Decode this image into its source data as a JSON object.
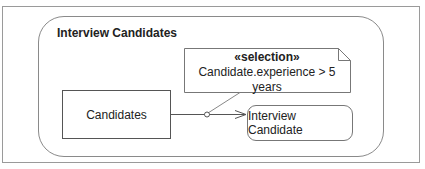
{
  "diagram": {
    "type": "UML activity diagram",
    "region": {
      "title": "Interview Candidates"
    },
    "nodes": [
      {
        "id": "candidates",
        "label": "Candidates",
        "kind": "object-node"
      },
      {
        "id": "interview-candidate",
        "label": "Interview Candidate",
        "kind": "action"
      }
    ],
    "note": {
      "stereotype": "«selection»",
      "body": "Candidate.experience > 5 years"
    },
    "edges": [
      {
        "from": "candidates",
        "to": "interview-candidate",
        "kind": "object-flow",
        "annotated_by": "note"
      }
    ],
    "colors": {
      "line": "#555555",
      "frame": "#9a9a9a",
      "text": "#222222"
    }
  }
}
